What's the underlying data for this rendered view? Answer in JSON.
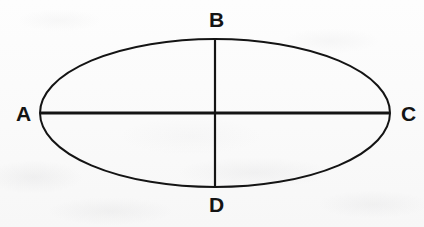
{
  "figure": {
    "type": "ellipse-with-axes",
    "background_color": "#fcfcfc",
    "stroke_color": "#141414",
    "labels": {
      "a": "A",
      "b": "B",
      "c": "C",
      "d": "D"
    },
    "geometry": {
      "center_x": 215,
      "center_y": 113,
      "radius_x": 175,
      "radius_y": 74,
      "outline_stroke_width": 2,
      "major_axis_stroke_width": 3.2,
      "minor_axis_stroke_width": 2.2
    },
    "points": {
      "a": {
        "x": 40,
        "y": 113
      },
      "b": {
        "x": 215,
        "y": 39
      },
      "c": {
        "x": 390,
        "y": 113
      },
      "d": {
        "x": 215,
        "y": 187
      }
    }
  }
}
